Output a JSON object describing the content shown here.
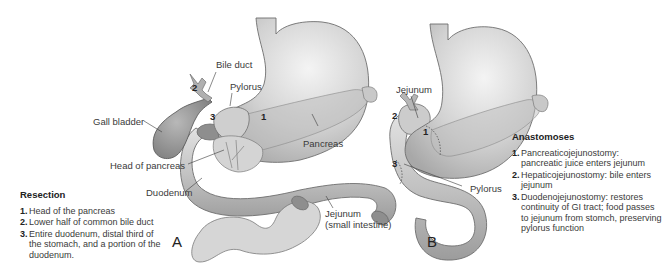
{
  "panel_a": {
    "letter": "A",
    "labels": {
      "bile_duct": "Bile duct",
      "pylorus": "Pylorus",
      "gall_bladder": "Gall bladder",
      "pancreas": "Pancreas",
      "head_of_pancreas": "Head of pancreas",
      "duodenum": "Duodenum",
      "jejunum": "Jejunum",
      "jejunum_sub": "(small intestine)"
    },
    "markers": [
      "1",
      "2",
      "3"
    ]
  },
  "panel_b": {
    "letter": "B",
    "labels": {
      "jejunum": "Jejunum",
      "pylorus": "Pylorus"
    },
    "markers": [
      "1",
      "2",
      "3"
    ]
  },
  "resection": {
    "title": "Resection",
    "items": [
      {
        "n": "1.",
        "text": "Head of the pancreas"
      },
      {
        "n": "2.",
        "text": "Lower half of common bile duct"
      },
      {
        "n": "3.",
        "text": "Entire duodenum, distal third of the stomach, and a portion of the duodenum."
      }
    ]
  },
  "anastomoses": {
    "title": "Anastomoses",
    "items": [
      {
        "n": "1.",
        "text": "Pancreaticojejunostomy: pancreatic juice enters jejunum"
      },
      {
        "n": "2.",
        "text": "Hepaticojejunostomy: bile enters jejunum"
      },
      {
        "n": "3.",
        "text": "Duodenojejunostomy: restores continuity of GI tract; food passes to jejunum from stomch, preserving pylorus function"
      }
    ]
  },
  "colors": {
    "organ_light": "#e6e6e6",
    "organ_mid": "#c4c4c4",
    "organ_dark": "#9a9a9a",
    "outline": "#6e6e6e",
    "text": "#3a3a3a"
  }
}
